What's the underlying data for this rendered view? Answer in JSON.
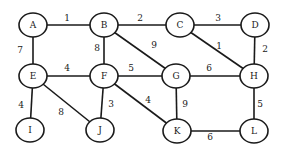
{
  "graph": {
    "nodes": [
      {
        "id": "A",
        "label": "A",
        "x": 33,
        "y": 25
      },
      {
        "id": "B",
        "label": "B",
        "x": 104,
        "y": 25
      },
      {
        "id": "C",
        "label": "C",
        "x": 180,
        "y": 25
      },
      {
        "id": "D",
        "label": "D",
        "x": 255,
        "y": 25
      },
      {
        "id": "E",
        "label": "E",
        "x": 33,
        "y": 76
      },
      {
        "id": "F",
        "label": "F",
        "x": 104,
        "y": 76
      },
      {
        "id": "G",
        "label": "G",
        "x": 176,
        "y": 76
      },
      {
        "id": "H",
        "label": "H",
        "x": 254,
        "y": 76
      },
      {
        "id": "I",
        "label": "I",
        "x": 30,
        "y": 130
      },
      {
        "id": "J",
        "label": "J",
        "x": 100,
        "y": 130
      },
      {
        "id": "K",
        "label": "K",
        "x": 177,
        "y": 131
      },
      {
        "id": "L",
        "label": "L",
        "x": 254,
        "y": 131
      }
    ],
    "edges": [
      {
        "from": "A",
        "to": "B",
        "weight": "1",
        "lx": 67,
        "ly": 18
      },
      {
        "from": "B",
        "to": "C",
        "weight": "2",
        "lx": 140,
        "ly": 18
      },
      {
        "from": "C",
        "to": "D",
        "weight": "3",
        "lx": 218,
        "ly": 18
      },
      {
        "from": "A",
        "to": "E",
        "weight": "7",
        "lx": 20,
        "ly": 50
      },
      {
        "from": "B",
        "to": "F",
        "weight": "8",
        "lx": 97,
        "ly": 48
      },
      {
        "from": "B",
        "to": "G",
        "weight": "9",
        "lx": 154,
        "ly": 45
      },
      {
        "from": "C",
        "to": "H",
        "weight": "1",
        "lx": 219,
        "ly": 46
      },
      {
        "from": "D",
        "to": "H",
        "weight": "2",
        "lx": 265,
        "ly": 49
      },
      {
        "from": "E",
        "to": "F",
        "weight": "4",
        "lx": 67,
        "ly": 68
      },
      {
        "from": "F",
        "to": "G",
        "weight": "5",
        "lx": 131,
        "ly": 68
      },
      {
        "from": "G",
        "to": "H",
        "weight": "6",
        "lx": 209,
        "ly": 68
      },
      {
        "from": "E",
        "to": "I",
        "weight": "4",
        "lx": 21,
        "ly": 105
      },
      {
        "from": "E",
        "to": "J",
        "weight": "8",
        "lx": 61,
        "ly": 112
      },
      {
        "from": "F",
        "to": "J",
        "weight": "3",
        "lx": 111,
        "ly": 104
      },
      {
        "from": "F",
        "to": "K",
        "weight": "4",
        "lx": 148,
        "ly": 100
      },
      {
        "from": "G",
        "to": "K",
        "weight": "9",
        "lx": 185,
        "ly": 104
      },
      {
        "from": "H",
        "to": "L",
        "weight": "5",
        "lx": 260,
        "ly": 104
      },
      {
        "from": "K",
        "to": "L",
        "weight": "6",
        "lx": 210,
        "ly": 137
      }
    ],
    "node_rx": 14,
    "node_ry": 12,
    "stroke_color": "#1a1a1a",
    "background": "#ffffff"
  }
}
